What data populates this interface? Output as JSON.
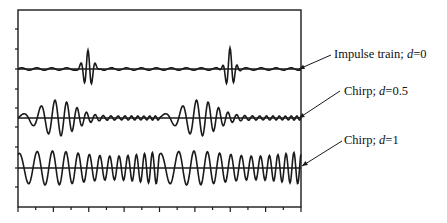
{
  "chart_data": {
    "type": "line",
    "title": "",
    "xlabel": "",
    "ylabel": "",
    "grid": false,
    "legend_position": "annotations-right",
    "frame": {
      "left": 18,
      "right": 301,
      "top": 10,
      "bottom": 207
    },
    "x_ticks_count": 16,
    "y_ticks_px": [
      29,
      49,
      69,
      89,
      108,
      127,
      147,
      168,
      187
    ],
    "series": [
      {
        "name": "Impulse train; d=0",
        "label_prefix": "Impulse train; ",
        "d_value": "0",
        "baseline_y": 69,
        "description": "Two short bursts (impulses) at ~x=65 and ~x=225 with small ripple elsewhere",
        "burst_centers_px": [
          88,
          230
        ],
        "amplitude_px": 20
      },
      {
        "name": "Chirp; d=0.5",
        "label_prefix": "Chirp; ",
        "d_value": "0.5",
        "baseline_y": 118,
        "description": "Two chirp packets with increasing frequency, peaks at ~x=85 and ~x=225",
        "burst_centers_px": [
          88,
          228
        ],
        "amplitude_px": 18
      },
      {
        "name": "Chirp; d=1",
        "label_prefix": "Chirp; ",
        "d_value": "1",
        "baseline_y": 168,
        "description": "Continuous chirp with near-constant amplitude over the whole window, two repeating periods",
        "amplitude_px": 17
      }
    ],
    "annotations": [
      {
        "text": "Impulse train; d=0",
        "x": 334,
        "y": 62,
        "arrow_from": [
          331,
          55
        ],
        "arrow_to": [
          299,
          69
        ]
      },
      {
        "text": "Chirp; d=0.5",
        "x": 344,
        "y": 99,
        "arrow_from": [
          340,
          91
        ],
        "arrow_to": [
          299,
          118
        ]
      },
      {
        "text": "Chirp; d=1",
        "x": 344,
        "y": 148,
        "arrow_from": [
          342,
          141
        ],
        "arrow_to": [
          302,
          166
        ]
      }
    ]
  },
  "labels": {
    "d_var": "d",
    "impulse": {
      "prefix": "Impulse train; ",
      "value": "=0"
    },
    "chirp05": {
      "prefix": "Chirp; ",
      "value": "=0.5"
    },
    "chirp1": {
      "prefix": "Chirp; ",
      "value": "=1"
    }
  }
}
